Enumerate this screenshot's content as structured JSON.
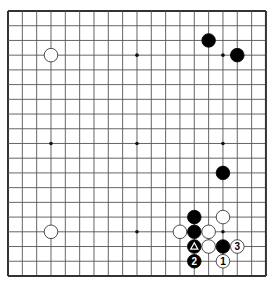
{
  "board": {
    "size": 19,
    "origin_x": 8,
    "origin_y": 11,
    "step_x": 14.33,
    "step_y": 14.72,
    "line_color": "#555555",
    "border_color": "#333333",
    "star_points": [
      [
        3,
        3
      ],
      [
        9,
        3
      ],
      [
        15,
        3
      ],
      [
        3,
        9
      ],
      [
        9,
        9
      ],
      [
        15,
        9
      ],
      [
        3,
        15
      ],
      [
        9,
        15
      ],
      [
        15,
        15
      ]
    ]
  },
  "stones": [
    {
      "color": "white",
      "col": 3,
      "row": 3
    },
    {
      "color": "black",
      "col": 14,
      "row": 2
    },
    {
      "color": "black",
      "col": 16,
      "row": 3
    },
    {
      "color": "black",
      "col": 15,
      "row": 11
    },
    {
      "color": "white",
      "col": 3,
      "row": 15
    },
    {
      "color": "black",
      "col": 13,
      "row": 14
    },
    {
      "color": "white",
      "col": 15,
      "row": 14
    },
    {
      "color": "white",
      "col": 12,
      "row": 15
    },
    {
      "color": "black",
      "col": 13,
      "row": 15
    },
    {
      "color": "white",
      "col": 14,
      "row": 15
    },
    {
      "color": "black",
      "col": 13,
      "row": 16,
      "mark": "triangle"
    },
    {
      "color": "white",
      "col": 14,
      "row": 16
    },
    {
      "color": "black",
      "col": 15,
      "row": 16
    },
    {
      "color": "white",
      "col": 16,
      "row": 16,
      "label": "3"
    },
    {
      "color": "black",
      "col": 13,
      "row": 17,
      "label": "2"
    },
    {
      "color": "white",
      "col": 15,
      "row": 17,
      "label": "1"
    }
  ]
}
